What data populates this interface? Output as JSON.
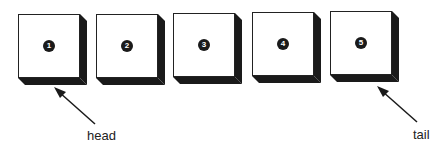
{
  "diagram": {
    "type": "linked-list-queue",
    "nodes": [
      {
        "id": 1,
        "label": "1",
        "x": 18,
        "y": 14
      },
      {
        "id": 2,
        "label": "2",
        "x": 96,
        "y": 14
      },
      {
        "id": 3,
        "label": "3",
        "x": 173,
        "y": 13
      },
      {
        "id": 4,
        "label": "4",
        "x": 252,
        "y": 12
      },
      {
        "id": 5,
        "label": "5",
        "x": 330,
        "y": 11
      }
    ],
    "pointers": {
      "head": {
        "label": "head",
        "points_to": 1
      },
      "tail": {
        "label": "tail",
        "points_to": 5
      }
    },
    "colors": {
      "stroke": "#222222",
      "shadow": "#1a1a1a",
      "fill": "#ffffff"
    }
  }
}
